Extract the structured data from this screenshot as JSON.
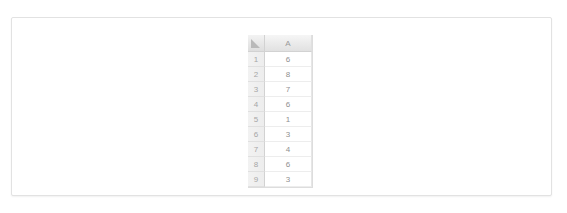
{
  "panel": {
    "background_color": "#ffffff",
    "border_color": "#e2e2e2"
  },
  "spreadsheet": {
    "corner_cell": {
      "icon": "select-all-triangle-icon",
      "label": ""
    },
    "column_headers": [
      "A"
    ],
    "row_headers": [
      "1",
      "2",
      "3",
      "4",
      "5",
      "6",
      "7",
      "8",
      "9"
    ],
    "rows": [
      {
        "row_header": "1",
        "values": [
          "6"
        ]
      },
      {
        "row_header": "2",
        "values": [
          "8"
        ]
      },
      {
        "row_header": "3",
        "values": [
          "7"
        ]
      },
      {
        "row_header": "4",
        "values": [
          "6"
        ]
      },
      {
        "row_header": "5",
        "values": [
          "1"
        ]
      },
      {
        "row_header": "6",
        "values": [
          "3"
        ]
      },
      {
        "row_header": "7",
        "values": [
          "4"
        ]
      },
      {
        "row_header": "8",
        "values": [
          "6"
        ]
      },
      {
        "row_header": "9",
        "values": [
          "3"
        ]
      }
    ],
    "header_text_color": "#9a9a9a",
    "cell_text_color": "#8f8f8f",
    "header_background_color": "#eaeaea",
    "gridline_color": "#e6e6e6"
  }
}
